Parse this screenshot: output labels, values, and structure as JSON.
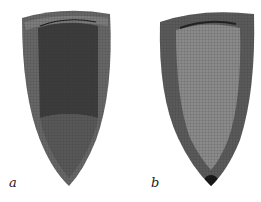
{
  "figure": {
    "panels": [
      {
        "id": "a",
        "label": "a",
        "description": "mesh model with dark inner region"
      },
      {
        "id": "b",
        "label": "b",
        "description": "mesh model with light inner region and dark apex"
      }
    ]
  },
  "colors": {
    "outer_mesh": "#5a5a5a",
    "inner_dark": "#3c3c3c",
    "inner_light": "#8a8a8a",
    "grid": "#2a2a2a",
    "background": "#ffffff"
  }
}
